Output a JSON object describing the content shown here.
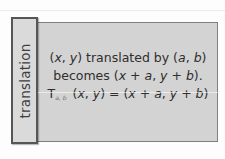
{
  "label": {
    "text": "translation"
  },
  "definition": {
    "line1": {
      "open": "(",
      "x": "x",
      "comma1": ", ",
      "y": "y",
      "mid": ") translated by (",
      "a": "a",
      "comma2": ", ",
      "b": "b",
      "close": ")"
    },
    "line2": {
      "prefix": "becomes (",
      "x": "x",
      "plus1": " + ",
      "a": "a",
      "comma": ", ",
      "y": "y",
      "plus2": " + ",
      "b": "b",
      "close": ")."
    },
    "line3": {
      "T": "T",
      "subscript": "a, b",
      "open": " (",
      "x": "x",
      "comma1": ", ",
      "y": "y",
      "eq": ") = (",
      "x2": "x",
      "plus1": " + ",
      "a": "a",
      "comma2": ", ",
      "y2": "y",
      "plus2": " + ",
      "b": "b",
      "close": ")"
    }
  },
  "colors": {
    "box_fill": "#d3d3d3",
    "label_fill": "#dadada",
    "label_border": "#565656",
    "text": "#2e2e2e"
  }
}
